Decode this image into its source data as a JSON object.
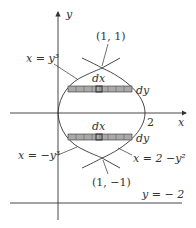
{
  "diagram": {
    "axes": {
      "x_label": "x",
      "y_label": "y"
    },
    "curves": {
      "upper_left": "x = y³",
      "lower_left": "x = −y³",
      "right": "x = 2 −y²"
    },
    "points": {
      "top_intersection": "(1, 1)",
      "bottom_intersection": "(1, −1)",
      "x_intercept": "2"
    },
    "line": {
      "label": "y = − 2"
    },
    "strips": {
      "upper_dx": "dx",
      "upper_dy": "dy",
      "lower_dx": "dx",
      "lower_dy": "dy"
    },
    "colors": {
      "stroke": "#333333",
      "strip_fill": "#a9a9a9"
    }
  }
}
